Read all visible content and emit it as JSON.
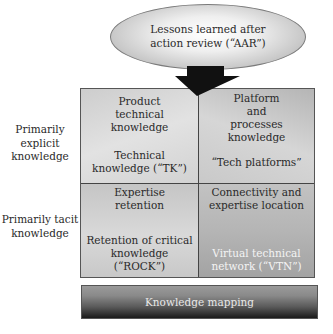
{
  "top_node": {
    "label": "Lessons learned after action review (“AAR”)"
  },
  "row_labels": [
    {
      "label": "Primarily explicit knowledge"
    },
    {
      "label": "Primarily tacit knowledge"
    }
  ],
  "grid": {
    "cells": [
      {
        "title": "Product technical knowledge",
        "name": "Technical knowledge (“TK”)"
      },
      {
        "title": "Platform and processes knowledge",
        "name": "“Tech platforms”"
      },
      {
        "title": "Expertise retention",
        "name": "Retention of critical knowledge (“ROCK”)"
      },
      {
        "title": "Connectivity and expertise location",
        "name": "Virtual technical network (“VTN”)"
      }
    ]
  },
  "foundation": {
    "label": "Knowledge mapping"
  },
  "colors": {
    "arrow": "#111111",
    "border": "#555555",
    "text_dark": "#2a2a2a",
    "text_light": "#f4f4f4"
  }
}
